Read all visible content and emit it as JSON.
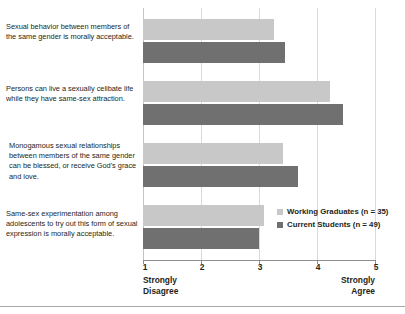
{
  "chart_data": {
    "type": "bar",
    "orientation": "horizontal",
    "title": "",
    "xlabel": "",
    "ylabel": "",
    "xlim": [
      1,
      5
    ],
    "xticks": [
      1,
      2,
      3,
      4,
      5
    ],
    "xtick_labels": [
      "1",
      "2",
      "3",
      "4",
      "5"
    ],
    "grid": true,
    "grid_axis": "x",
    "legend_position": "inside-right-lower",
    "scale_min_caption": "Strongly\nDisagree",
    "scale_max_caption": "Strongly\nAgree",
    "scale_min_caption_line1": "Strongly",
    "scale_min_caption_line2": "Disagree",
    "scale_max_caption_line1": "Strongly",
    "scale_max_caption_line2": "Agree",
    "categories": [
      "Sexual behavior between members of the same gender is morally acceptable.",
      "Persons can live a sexually celibate life while they have same-sex attraction.",
      "Monogamous sexual relationships between members of the same gender can be blessed, or receive God's grace and love.",
      "Same-sex experimentation among adolescents to try out this form of sexual expression is morally acceptable."
    ],
    "series": [
      {
        "name": "Working Graduates (n = 35)",
        "color": "#c8c8c8",
        "values": [
          3.26,
          4.22,
          3.41,
          3.09
        ]
      },
      {
        "name": "Current Students (n = 49)",
        "color": "#707070",
        "values": [
          3.45,
          4.45,
          3.67,
          3.0
        ]
      }
    ]
  },
  "legend": [
    {
      "label": "Working Graduates (n = 35)",
      "color": "#c8c8c8"
    },
    {
      "label": "Current Students (n = 49)",
      "color": "#707070"
    }
  ],
  "categories_display": [
    {
      "line1": "Sexual behavior between members of",
      "line2": "the same gender is morally acceptable."
    },
    {
      "line1": "Persons can live a sexually celibate life",
      "line2": "while they have same-sex attraction."
    },
    {
      "line1": "Monogamous sexual relationships",
      "line2": "between members of the same gender",
      "line3": "can be blessed, or receive God's grace",
      "line4": "and love."
    },
    {
      "line1": "Same-sex experimentation among",
      "line2": "adolescents to try out this form of sexual",
      "line3": "expression is morally acceptable."
    }
  ],
  "axis": {
    "tick_1": "1",
    "tick_2": "2",
    "tick_3": "3",
    "tick_4": "4",
    "tick_5": "5",
    "left_caption_line1": "Strongly",
    "left_caption_line2": "Disagree",
    "right_caption_line1": "Strongly",
    "right_caption_line2": "Agree"
  }
}
